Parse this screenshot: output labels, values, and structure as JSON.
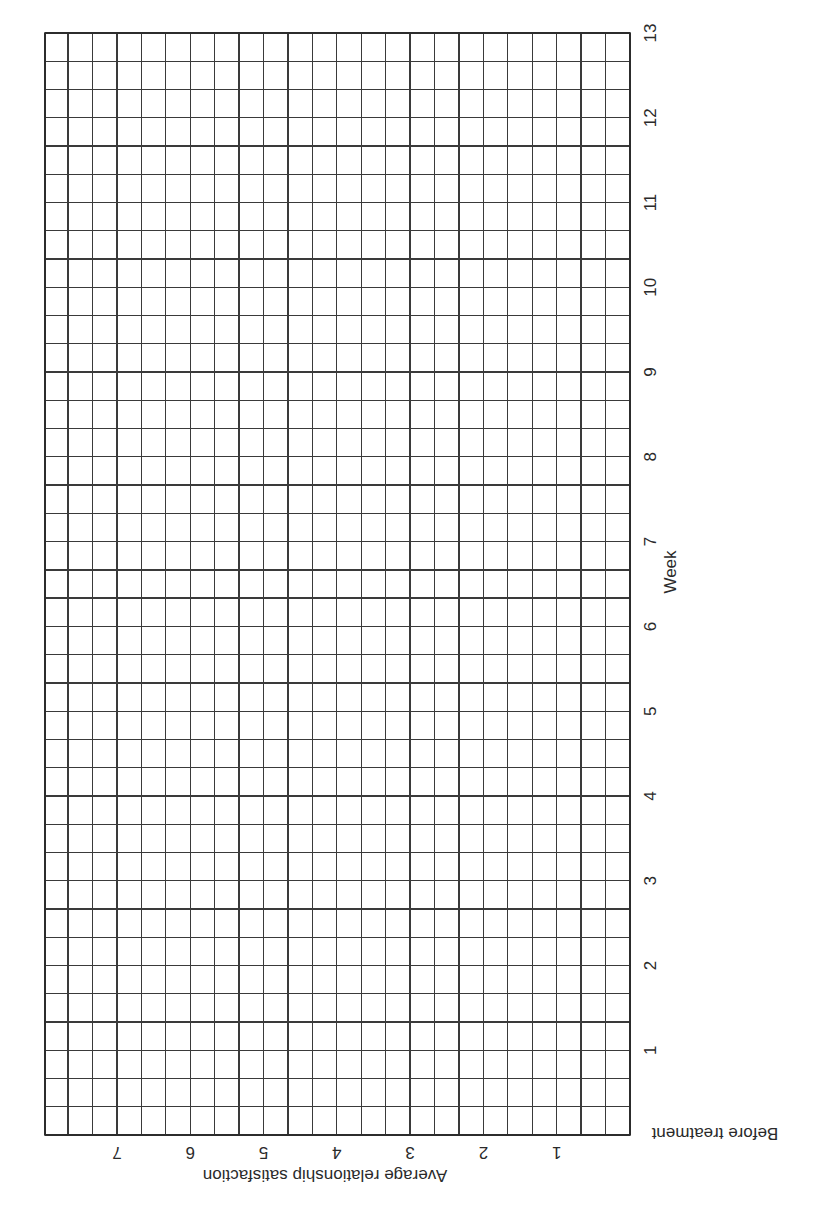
{
  "chart_data": {
    "type": "line",
    "title": "",
    "orientation_note": "Page is rotated: week axis runs vertically on the right, satisfaction axis runs horizontally along the bottom (text rendered upside down).",
    "xlabel": "Week",
    "ylabel": "Average relationship satisfaction",
    "x_ticks": [
      "Before treatment",
      "1",
      "2",
      "3",
      "4",
      "5",
      "6",
      "7",
      "8",
      "9",
      "10",
      "11",
      "12",
      "13"
    ],
    "y_ticks": [
      "1",
      "2",
      "3",
      "4",
      "5",
      "6",
      "7"
    ],
    "xlim": [
      0,
      13
    ],
    "ylim": [
      0,
      8
    ],
    "x_minor_divisions_per_tick": 3,
    "y_minor_divisions_per_tick": 3,
    "grid": true,
    "series": [],
    "note": "Blank graph-paper template; no data points plotted."
  },
  "axes": {
    "week_axis": {
      "title": "Week",
      "start_label": "Before treatment",
      "ticks": [
        "1",
        "2",
        "3",
        "4",
        "5",
        "6",
        "7",
        "8",
        "9",
        "10",
        "11",
        "12",
        "13"
      ]
    },
    "satisfaction_axis": {
      "title": "Average relationship satisfaction",
      "ticks": [
        "1",
        "2",
        "3",
        "4",
        "5",
        "6",
        "7"
      ]
    }
  },
  "colors": {
    "grid": "#3a3a3a",
    "text": "#2a2a2a",
    "background": "#ffffff"
  }
}
